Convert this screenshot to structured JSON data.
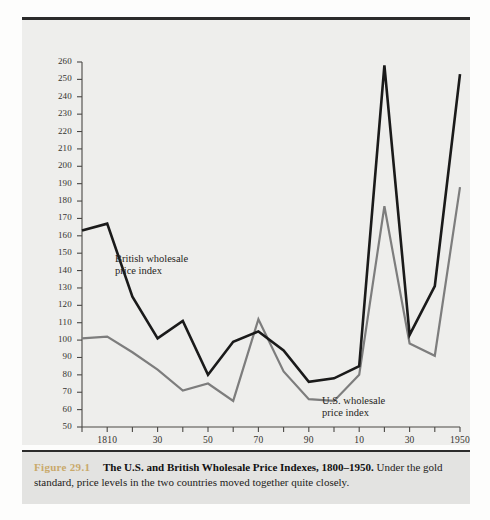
{
  "figure": {
    "number_label": "Figure 29.1",
    "title": "The U.S. and British Wholesale Price Indexes, 1800–1950.",
    "description": "Under the gold standard, price levels in the two countries moved together quite closely.",
    "number_color": "#c9a96a",
    "panel_background": "#eeeeec",
    "caption_background": "#e3e3e1"
  },
  "annotations": {
    "british_label": "British wholesale\nprice index",
    "us_label": "U.S. wholesale\nprice index"
  },
  "chart_data": {
    "type": "line",
    "title": "The U.S. and British Wholesale Price Indexes, 1800–1950",
    "xlabel": "",
    "ylabel": "",
    "xlim": [
      1800,
      1950
    ],
    "ylim": [
      50,
      260
    ],
    "ytick_step": 10,
    "yticks": [
      50,
      60,
      70,
      80,
      90,
      100,
      110,
      120,
      130,
      140,
      150,
      160,
      170,
      180,
      190,
      200,
      210,
      220,
      230,
      240,
      250,
      260
    ],
    "ytick_labels": [
      "50",
      "60",
      "70",
      "80",
      "90",
      "100",
      "110",
      "120",
      "130",
      "140",
      "150",
      "160",
      "170",
      "180",
      "190",
      "200",
      "210",
      "220",
      "230",
      "240",
      "250",
      "260"
    ],
    "xticks": [
      1800,
      1810,
      1820,
      1830,
      1840,
      1850,
      1860,
      1870,
      1880,
      1890,
      1900,
      1910,
      1920,
      1930,
      1940,
      1950
    ],
    "xtick_labels": [
      "",
      "1810",
      "",
      "30",
      "",
      "50",
      "",
      "70",
      "",
      "90",
      "",
      "10",
      "",
      "30",
      "",
      "1950"
    ],
    "grid": false,
    "legend": "inline-annotations",
    "x": [
      1800,
      1810,
      1820,
      1830,
      1840,
      1850,
      1860,
      1870,
      1880,
      1890,
      1900,
      1910,
      1920,
      1930,
      1940,
      1950
    ],
    "series": [
      {
        "name": "British wholesale price index",
        "color": "#1a1a1a",
        "width": 2.6,
        "values": [
          163,
          167,
          125,
          101,
          111,
          80,
          99,
          105,
          94,
          76,
          78,
          85,
          258,
          103,
          131,
          253
        ]
      },
      {
        "name": "U.S. wholesale price index",
        "color": "#7d7d7d",
        "width": 2.2,
        "values": [
          101,
          102,
          93,
          83,
          71,
          75,
          65,
          112,
          82,
          66,
          65,
          80,
          177,
          98,
          91,
          188
        ]
      }
    ]
  }
}
